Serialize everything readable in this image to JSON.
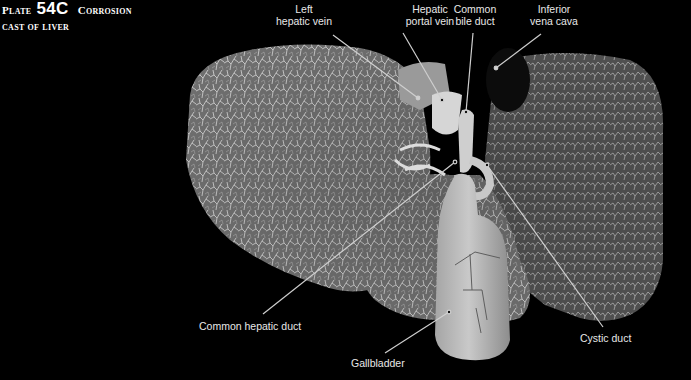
{
  "title": {
    "plate_prefix": "Plate",
    "plate_number": "54C",
    "line1_rest": "Corrosion",
    "line2": "cast of liver"
  },
  "labels": [
    {
      "id": "left-hepatic-vein",
      "lines": [
        "Left",
        "hepatic vein"
      ]
    },
    {
      "id": "hepatic-portal-vein",
      "lines": [
        "Hepatic",
        "portal vein"
      ]
    },
    {
      "id": "common-bile-duct",
      "lines": [
        "Common",
        "bile duct"
      ]
    },
    {
      "id": "inferior-vena-cava",
      "lines": [
        "Inferior",
        "vena cava"
      ]
    },
    {
      "id": "common-hepatic-duct",
      "lines": [
        "Common hepatic duct"
      ]
    },
    {
      "id": "gallbladder",
      "lines": [
        "Gallbladder"
      ]
    },
    {
      "id": "cystic-duct",
      "lines": [
        "Cystic duct"
      ]
    }
  ],
  "colors": {
    "background": "#000000",
    "label_text": "#e8e8e8",
    "leader_line": "#cfcfcf",
    "liver_tissue": "#8a8a8a",
    "gallbladder": "#b8b8b8"
  }
}
